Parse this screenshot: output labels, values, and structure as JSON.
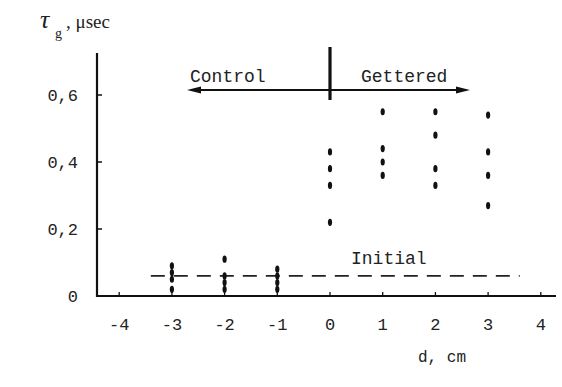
{
  "chart_data": {
    "type": "scatter",
    "title": "",
    "ylabel_symbol": "τ",
    "ylabel_subscript": "g",
    "ylabel_unit": ", μsec",
    "xlabel": "d, cm",
    "xlim": [
      -4,
      4
    ],
    "ylim": [
      0,
      0.7
    ],
    "grid": false,
    "x_ticks": [
      -4,
      -3,
      -2,
      -1,
      0,
      1,
      2,
      3,
      4
    ],
    "x_tick_labels": [
      "-4",
      "-3",
      "-2",
      "-1",
      "0",
      "1",
      "2",
      "3",
      "4"
    ],
    "y_ticks": [
      0,
      0.2,
      0.4,
      0.6
    ],
    "y_tick_labels": [
      "0",
      "0,2",
      "0,4",
      "0,6"
    ],
    "series": [
      {
        "name": "Control",
        "points": [
          {
            "x": -3,
            "y": 0.09
          },
          {
            "x": -3,
            "y": 0.07
          },
          {
            "x": -3,
            "y": 0.05
          },
          {
            "x": -3,
            "y": 0.02
          },
          {
            "x": -2,
            "y": 0.11
          },
          {
            "x": -2,
            "y": 0.06
          },
          {
            "x": -2,
            "y": 0.04
          },
          {
            "x": -2,
            "y": 0.02
          },
          {
            "x": -1,
            "y": 0.08
          },
          {
            "x": -1,
            "y": 0.06
          },
          {
            "x": -1,
            "y": 0.04
          },
          {
            "x": -1,
            "y": 0.02
          }
        ]
      },
      {
        "name": "Gettered",
        "points": [
          {
            "x": 0,
            "y": 0.43
          },
          {
            "x": 0,
            "y": 0.38
          },
          {
            "x": 0,
            "y": 0.33
          },
          {
            "x": 0,
            "y": 0.22
          },
          {
            "x": 1,
            "y": 0.55
          },
          {
            "x": 1,
            "y": 0.44
          },
          {
            "x": 1,
            "y": 0.4
          },
          {
            "x": 1,
            "y": 0.36
          },
          {
            "x": 2,
            "y": 0.55
          },
          {
            "x": 2,
            "y": 0.48
          },
          {
            "x": 2,
            "y": 0.38
          },
          {
            "x": 2,
            "y": 0.33
          },
          {
            "x": 3,
            "y": 0.54
          },
          {
            "x": 3,
            "y": 0.43
          },
          {
            "x": 3,
            "y": 0.36
          },
          {
            "x": 3,
            "y": 0.27
          }
        ]
      }
    ],
    "reference_lines": [
      {
        "name": "Initial",
        "y": 0.06,
        "style": "dashed",
        "x_range": [
          -3.4,
          3.6
        ]
      }
    ],
    "annotations": [
      {
        "text": "Control",
        "arrow": "left",
        "region": "x < 0"
      },
      {
        "text": "Gettered",
        "arrow": "right",
        "region": "x > 0"
      },
      {
        "text": "Initial",
        "note": "label above dashed initial-level line"
      }
    ],
    "divider_x": 0
  },
  "labels": {
    "control": "Control",
    "gettered": "Gettered",
    "initial": "Initial",
    "y_symbol": "τ",
    "y_sub": "g",
    "y_unit": ", μsec",
    "x_axis": "d,  cm"
  }
}
